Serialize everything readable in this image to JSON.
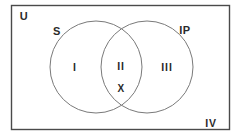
{
  "figure": {
    "type": "venn-diagram",
    "sets_count": 2,
    "universe_label": "U",
    "outline_color": "#4a4a4a",
    "circle_color": "#7a7a7a",
    "text_color": "#2b2b2b",
    "background": "#ffffff"
  },
  "universe": {
    "label": "U",
    "x": 24,
    "y": 16
  },
  "sets": [
    {
      "name": "set-s",
      "label": "S",
      "label_x": 57,
      "label_y": 31,
      "cx": 96,
      "cy": 67,
      "r": 46
    },
    {
      "name": "set-ip",
      "label": "IP",
      "label_x": 185,
      "label_y": 30,
      "cx": 147,
      "cy": 67,
      "r": 46
    }
  ],
  "regions": [
    {
      "name": "region-one",
      "label": "I",
      "x": 75,
      "y": 67
    },
    {
      "name": "region-two",
      "label": "II",
      "x": 121,
      "y": 66
    },
    {
      "name": "region-three",
      "label": "III",
      "x": 167,
      "y": 67
    },
    {
      "name": "region-four",
      "label": "IV",
      "x": 211,
      "y": 123
    }
  ],
  "elements": [
    {
      "name": "element-x",
      "label": "X",
      "x": 121,
      "y": 89,
      "in_region": "II"
    }
  ]
}
